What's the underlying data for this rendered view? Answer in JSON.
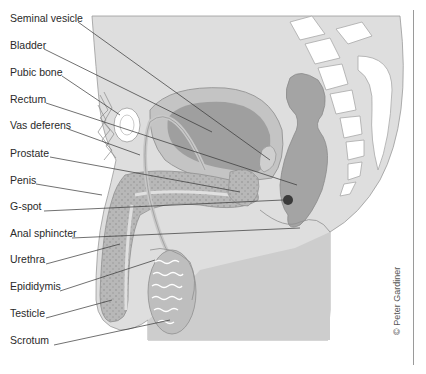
{
  "diagram": {
    "credit": "© Peter Gardiner",
    "labels": [
      {
        "text": "Seminal vesicle",
        "y": 17
      },
      {
        "text": "Bladder",
        "y": 44
      },
      {
        "text": "Pubic bone",
        "y": 71
      },
      {
        "text": "Rectum",
        "y": 98
      },
      {
        "text": "Vas deferens",
        "y": 124
      },
      {
        "text": "Prostate",
        "y": 152
      },
      {
        "text": "Penis",
        "y": 179
      },
      {
        "text": "G-spot",
        "y": 205
      },
      {
        "text": "Anal sphincter",
        "y": 232
      },
      {
        "text": "Urethra",
        "y": 258
      },
      {
        "text": "Epididymis",
        "y": 285
      },
      {
        "text": "Testicle",
        "y": 312
      },
      {
        "text": "Scrotum",
        "y": 339
      }
    ],
    "colors": {
      "body_fill": "#dcdcdc",
      "organ_dark": "#9c9c9c",
      "organ_mid": "#b4b4b4",
      "bone": "#ffffff",
      "leader_line": "#333333",
      "gspot": "#3a3a3a"
    }
  }
}
